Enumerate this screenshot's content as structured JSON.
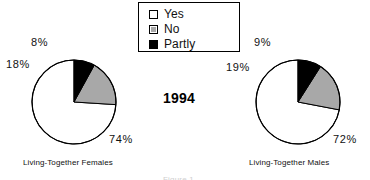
{
  "legend": {
    "items": [
      {
        "label": "Yes",
        "swatch": "yes-swatch-icon",
        "color": "#ffffff"
      },
      {
        "label": "No",
        "swatch": "no-swatch-icon",
        "color": "#a8a8a8"
      },
      {
        "label": "Partly",
        "swatch": "partly-swatch-icon",
        "color": "#000000"
      }
    ]
  },
  "year_label": "1994",
  "captions": {
    "left": "Living-Together Females",
    "right": "Living-Together Males"
  },
  "figure_note": "Figure 1",
  "labels": {
    "left": {
      "yes": "74%",
      "no": "18%",
      "partly": "8%"
    },
    "right": {
      "yes": "72%",
      "no": "19%",
      "partly": "9%"
    }
  },
  "chart_data": {
    "type": "pie",
    "title": "1994",
    "xlabel": "",
    "ylabel": "",
    "legend_position": "top-center",
    "categories": [
      "Yes",
      "No",
      "Partly"
    ],
    "colors": [
      "#ffffff",
      "#a8a8a8",
      "#000000"
    ],
    "charts": [
      {
        "name": "Living-Together Females",
        "caption": "Living-Together Females",
        "values": [
          74,
          18,
          8
        ],
        "labels": [
          "74%",
          "18%",
          "8%"
        ],
        "unit": "percent",
        "start_angle_deg": 0,
        "direction": "counterclockwise"
      },
      {
        "name": "Living-Together Males",
        "caption": "Living-Together Males",
        "values": [
          72,
          19,
          9
        ],
        "labels": [
          "72%",
          "19%",
          "9%"
        ],
        "unit": "percent",
        "start_angle_deg": 0,
        "direction": "counterclockwise"
      }
    ]
  }
}
